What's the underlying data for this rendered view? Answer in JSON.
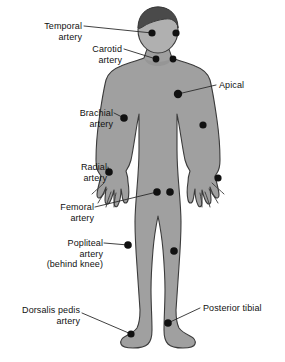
{
  "figure": {
    "colors": {
      "background": "#ffffff",
      "body_fill": "#a0a0a0",
      "body_outline": "#3b3b3b",
      "hair_fill": "#4a4a4a",
      "face_fill": "#b0b0b0",
      "dot_fill": "#111111",
      "leader_line": "#2b2b2b",
      "text": "#111111"
    },
    "labels": [
      {
        "id": "temporal",
        "side": "left",
        "lines": [
          "Temporal",
          "artery"
        ]
      },
      {
        "id": "carotid",
        "side": "left",
        "lines": [
          "Carotid",
          "artery"
        ]
      },
      {
        "id": "apical",
        "side": "right",
        "lines": [
          "Apical"
        ]
      },
      {
        "id": "brachial",
        "side": "left",
        "lines": [
          "Brachial",
          "artery"
        ]
      },
      {
        "id": "radial",
        "side": "left",
        "lines": [
          "Radial",
          "artery"
        ]
      },
      {
        "id": "femoral",
        "side": "left",
        "lines": [
          "Femoral",
          "artery"
        ]
      },
      {
        "id": "popliteal",
        "side": "left",
        "lines": [
          "Popliteal",
          "artery",
          "(behind knee)"
        ]
      },
      {
        "id": "dorsalis_pedis",
        "side": "left",
        "lines": [
          "Dorsalis pedis",
          "artery"
        ]
      },
      {
        "id": "posterior_tibial",
        "side": "right",
        "lines": [
          "Posterior tibial"
        ]
      }
    ],
    "pulse_points": [
      {
        "id": "temporal_left",
        "label": "temporal",
        "x": 152,
        "y": 33
      },
      {
        "id": "temporal_right",
        "label": "temporal",
        "x": 176,
        "y": 33
      },
      {
        "id": "carotid_left",
        "label": "carotid",
        "x": 156,
        "y": 59
      },
      {
        "id": "carotid_right",
        "label": "carotid",
        "x": 173,
        "y": 59
      },
      {
        "id": "apical",
        "label": "apical",
        "x": 178,
        "y": 94
      },
      {
        "id": "brachial_left",
        "label": "brachial",
        "x": 124,
        "y": 118
      },
      {
        "id": "brachial_right",
        "label": "brachial",
        "x": 203,
        "y": 125
      },
      {
        "id": "radial_left",
        "label": "radial",
        "x": 109,
        "y": 172
      },
      {
        "id": "radial_right",
        "label": "radial",
        "x": 218,
        "y": 178
      },
      {
        "id": "femoral_left",
        "label": "femoral",
        "x": 157,
        "y": 192
      },
      {
        "id": "femoral_right",
        "label": "femoral",
        "x": 170,
        "y": 192
      },
      {
        "id": "popliteal_left",
        "label": "popliteal",
        "x": 128,
        "y": 245
      },
      {
        "id": "popliteal_right",
        "label": "popliteal",
        "x": 174,
        "y": 251
      },
      {
        "id": "dorsalis_pedis",
        "label": "dorsalis_pedis",
        "x": 131,
        "y": 334
      },
      {
        "id": "posterior_tibial",
        "label": "posterior_tibial",
        "x": 168,
        "y": 323
      }
    ],
    "caption": ""
  }
}
